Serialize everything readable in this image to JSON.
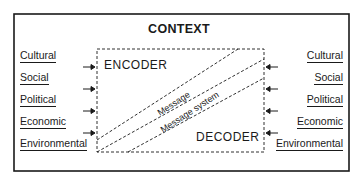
{
  "diagram": {
    "title": "CONTEXT",
    "encoder_label": "ENCODER",
    "decoder_label": "DECODER",
    "channel_labels": {
      "message": "Message",
      "message_system": "Message system"
    },
    "left_factors": [
      "Cultural",
      "Social",
      "Political",
      "Economic",
      "Environmental"
    ],
    "right_factors": [
      "Cultural",
      "Social",
      "Political",
      "Economic",
      "Environmental"
    ],
    "left_arrows": [
      "arrow-right",
      "arrow-right",
      "arrow-right",
      "arrow-right"
    ],
    "right_arrows": [
      "arrow-left",
      "arrow-left",
      "arrow-left",
      "arrow-left"
    ],
    "colors": {
      "ink": "#1a1a1a",
      "background": "#ffffff"
    }
  }
}
